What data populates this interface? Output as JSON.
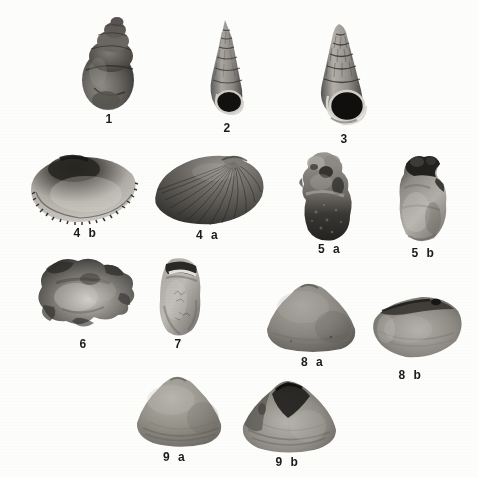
{
  "plate": {
    "kind": "paleontological-specimen-plate",
    "medium": "black-and-white photographic plate",
    "background_color": "#fdfdfc",
    "ink_color": "#1b1b1b",
    "width": 478,
    "height": 477,
    "specimen_count": 13,
    "figure_number_count": 9
  },
  "labels": [
    {
      "id": "fig-1",
      "text": "1",
      "x": 110,
      "y": 118
    },
    {
      "id": "fig-2",
      "text": "2",
      "x": 228,
      "y": 127
    },
    {
      "id": "fig-3",
      "text": "3",
      "x": 345,
      "y": 138
    },
    {
      "id": "fig-4b",
      "text": "4 b",
      "x": 86,
      "y": 232
    },
    {
      "id": "fig-4a",
      "text": "4 a",
      "x": 208,
      "y": 234
    },
    {
      "id": "fig-5a",
      "text": "5 a",
      "x": 330,
      "y": 248
    },
    {
      "id": "fig-5b",
      "text": "5 b",
      "x": 424,
      "y": 252
    },
    {
      "id": "fig-6",
      "text": "6",
      "x": 84,
      "y": 343
    },
    {
      "id": "fig-7",
      "text": "7",
      "x": 179,
      "y": 343
    },
    {
      "id": "fig-8a",
      "text": "8 a",
      "x": 313,
      "y": 361
    },
    {
      "id": "fig-8b",
      "text": "8 b",
      "x": 411,
      "y": 374
    },
    {
      "id": "fig-9a",
      "text": "9 a",
      "x": 175,
      "y": 456
    },
    {
      "id": "fig-9b",
      "text": "9 b",
      "x": 288,
      "y": 461
    }
  ],
  "specimens": [
    {
      "id": "specimen-1",
      "figure": "1",
      "type": "gastropod",
      "description": "squat ovate high-spired snail shell, dark tone, about four convex whorls",
      "tone": "dark",
      "box": {
        "x": 78,
        "y": 14,
        "width": 62,
        "height": 98
      }
    },
    {
      "id": "specimen-2",
      "figure": "2",
      "type": "gastropod",
      "description": "slender tall turreted snail shell with many ribbed whorls and dark oval aperture",
      "tone": "medium",
      "box": {
        "x": 199,
        "y": 18,
        "width": 54,
        "height": 104
      }
    },
    {
      "id": "specimen-3",
      "figure": "3",
      "type": "gastropod",
      "description": "conical snail shell with strongly ribbed whorls and large dark rounded aperture",
      "tone": "medium",
      "box": {
        "x": 311,
        "y": 22,
        "width": 62,
        "height": 110
      }
    },
    {
      "id": "specimen-4b",
      "figure": "4 b",
      "type": "bivalve",
      "description": "interior view of bivalve valve showing dark umbonal shading and crenulated toothed ventral margin",
      "tone": "light-with-dark-umbo",
      "box": {
        "x": 26,
        "y": 152,
        "width": 114,
        "height": 73
      }
    },
    {
      "id": "specimen-4a",
      "figure": "4 a",
      "type": "bivalve",
      "description": "exterior view of bivalve valve with fine radial ribs fanning from the umbo",
      "tone": "dark",
      "box": {
        "x": 152,
        "y": 150,
        "width": 116,
        "height": 78
      }
    },
    {
      "id": "specimen-5a",
      "figure": "5 a",
      "type": "oyster",
      "description": "irregular encrusting oyster-like shell, rough knobbed upper part, dark lower body",
      "tone": "mixed",
      "box": {
        "x": 294,
        "y": 150,
        "width": 62,
        "height": 92
      }
    },
    {
      "id": "specimen-5b",
      "figure": "5 b",
      "type": "oyster",
      "description": "opposite view of irregular oyster-like shell, pale body with dark knobbed beak",
      "tone": "light",
      "box": {
        "x": 390,
        "y": 152,
        "width": 62,
        "height": 92
      }
    },
    {
      "id": "specimen-6",
      "figure": "6",
      "type": "oyster",
      "description": "broad irregular oyster fragment, mottled light and dark, ragged margin",
      "tone": "mixed",
      "box": {
        "x": 32,
        "y": 253,
        "width": 104,
        "height": 80
      }
    },
    {
      "id": "specimen-7",
      "figure": "7",
      "type": "bivalve",
      "description": "elongate curved valve, pale with dark band near the top and faint interior markings",
      "tone": "light",
      "box": {
        "x": 152,
        "y": 256,
        "width": 56,
        "height": 82
      }
    },
    {
      "id": "specimen-8a",
      "figure": "8 a",
      "type": "bivalve",
      "description": "smooth trigonal-ovate bivalve valve, even mid-grey tone, exterior view",
      "tone": "medium",
      "box": {
        "x": 261,
        "y": 281,
        "width": 98,
        "height": 73
      }
    },
    {
      "id": "specimen-8b",
      "figure": "8 b",
      "type": "bivalve",
      "description": "smooth rounded-trigonal bivalve valve tilted left, darker along hinge line",
      "tone": "medium",
      "box": {
        "x": 368,
        "y": 293,
        "width": 96,
        "height": 70
      }
    },
    {
      "id": "specimen-9a",
      "figure": "9 a",
      "type": "bivalve",
      "description": "smooth trigonal bivalve valve with pointed umbo, pale grey, faint growth lines near margin",
      "tone": "light-medium",
      "box": {
        "x": 131,
        "y": 374,
        "width": 93,
        "height": 74
      }
    },
    {
      "id": "specimen-9b",
      "figure": "9 b",
      "type": "bivalve",
      "description": "trigonal bivalve valve with dark triangular umbonal area and lighter disc",
      "tone": "mixed",
      "box": {
        "x": 238,
        "y": 378,
        "width": 101,
        "height": 74
      }
    }
  ]
}
